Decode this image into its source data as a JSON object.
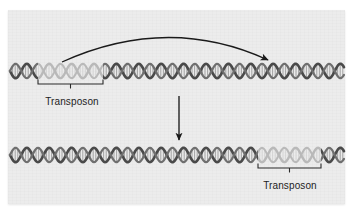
{
  "figure": {
    "type": "biology-diagram",
    "panel": {
      "background_color": "#ececec",
      "x": 8,
      "y": 10,
      "width": 337,
      "height": 194
    }
  },
  "colors": {
    "dna_backbone_dark": "#4a4a4a",
    "dna_backbone_mid": "#6f6f6f",
    "dna_rung": "#8d8d8d",
    "transposon_light": "#b9b9b9",
    "transposon_rung": "#cfcfcf",
    "arrow": "#1a1a1a",
    "bracket": "#2a2a2a",
    "text": "#1d1d1d",
    "page_background": "#ffffff"
  },
  "strands": [
    {
      "id": "top-strand",
      "name": "dna-strand-before-transposition",
      "y_center": 71,
      "x_start": 10,
      "x_end": 344,
      "transposon": {
        "label": "Transposon",
        "x_start": 38,
        "x_end": 103,
        "bracket_y": 84,
        "label_x": 72,
        "label_y": 96
      }
    },
    {
      "id": "bottom-strand",
      "name": "dna-strand-after-transposition",
      "y_center": 155,
      "x_start": 10,
      "x_end": 344,
      "transposon": {
        "label": "Transposon",
        "x_start": 258,
        "x_end": 321,
        "bracket_y": 168,
        "label_x": 290,
        "label_y": 180
      }
    }
  ],
  "arrows": [
    {
      "id": "transposition-arc",
      "name": "curved-transposition-arrow",
      "description": "curved arrow from transposon origin to insertion site",
      "start_x": 62,
      "start_y": 62,
      "peak_x": 168,
      "peak_y": 26,
      "end_x": 268,
      "end_y": 60
    },
    {
      "id": "result-arrow",
      "name": "downward-result-arrow",
      "description": "vertical arrow indicating resulting strand",
      "x": 179,
      "start_y": 96,
      "end_y": 140
    }
  ],
  "labels": {
    "transposon_top": "Transposon",
    "transposon_bottom": "Transposon"
  }
}
